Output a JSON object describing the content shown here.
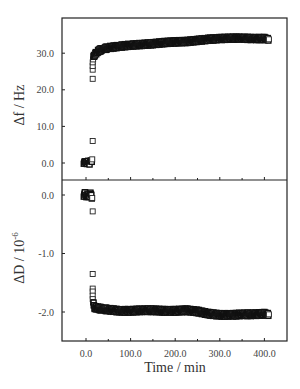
{
  "chart_data": [
    {
      "type": "scatter",
      "panel": "top",
      "title": "",
      "xlabel": "",
      "ylabel": "Δf / Hz",
      "ylim": [
        -4,
        37
      ],
      "xlim": [
        -50,
        450
      ],
      "yticks": [
        0,
        10,
        20,
        30
      ],
      "ytick_labels": [
        "0.0",
        "10.0",
        "20.0",
        "30.0"
      ],
      "grid": false,
      "marker": "open-square",
      "series": [
        {
          "name": "Δf",
          "x": [
            -5,
            -2,
            0,
            2,
            5,
            8,
            10,
            12,
            14,
            15,
            15,
            15,
            15,
            15,
            16,
            17,
            18,
            20,
            25,
            30,
            40,
            50,
            75,
            100,
            125,
            150,
            175,
            200,
            225,
            250,
            275,
            300,
            325,
            350,
            375,
            400,
            410
          ],
          "y": [
            0.2,
            0.0,
            0.3,
            0.1,
            0.2,
            0.0,
            0.3,
            0.5,
            1.0,
            6.0,
            23.0,
            25.5,
            26.5,
            27.5,
            28.3,
            28.8,
            29.3,
            29.8,
            30.3,
            30.8,
            31.2,
            31.5,
            31.9,
            32.2,
            32.4,
            32.6,
            32.9,
            33.1,
            33.2,
            33.5,
            33.8,
            34.0,
            34.1,
            34.1,
            34.0,
            34.0,
            33.8
          ]
        }
      ]
    },
    {
      "type": "scatter",
      "panel": "bottom",
      "title": "",
      "xlabel": "Time / min",
      "ylabel": "ΔD / 10⁻⁶",
      "ylim": [
        -2.5,
        0.25
      ],
      "xlim": [
        -50,
        450
      ],
      "xticks": [
        0,
        100,
        200,
        300,
        400
      ],
      "xtick_labels": [
        "0.0",
        "100.0",
        "200.0",
        "300.0",
        "400.0"
      ],
      "yticks": [
        0,
        -1,
        -2
      ],
      "ytick_labels": [
        "0.0",
        "-1.0",
        "-2.0"
      ],
      "grid": false,
      "marker": "open-square",
      "series": [
        {
          "name": "ΔD",
          "x": [
            -5,
            -2,
            0,
            2,
            5,
            8,
            10,
            12,
            14,
            15,
            15,
            15,
            15,
            15,
            15,
            16,
            17,
            18,
            20,
            25,
            30,
            40,
            50,
            75,
            100,
            125,
            150,
            175,
            200,
            225,
            250,
            275,
            300,
            325,
            350,
            375,
            400,
            410
          ],
          "y": [
            0.0,
            0.02,
            -0.03,
            0.01,
            -0.02,
            0.0,
            0.02,
            -0.01,
            -0.05,
            -0.28,
            -1.35,
            -1.6,
            -1.65,
            -1.72,
            -1.78,
            -1.83,
            -1.87,
            -1.9,
            -1.92,
            -1.93,
            -1.94,
            -1.95,
            -1.96,
            -1.98,
            -1.98,
            -1.97,
            -1.97,
            -1.98,
            -1.98,
            -1.97,
            -1.99,
            -2.03,
            -2.05,
            -2.05,
            -2.04,
            -2.04,
            -2.03,
            -2.04
          ]
        }
      ]
    }
  ],
  "labels": {
    "top_ylabel": "Δf / Hz",
    "bottom_ylabel_main": "ΔD / 10",
    "bottom_ylabel_exp": "-6",
    "xlabel": "Time / min"
  }
}
